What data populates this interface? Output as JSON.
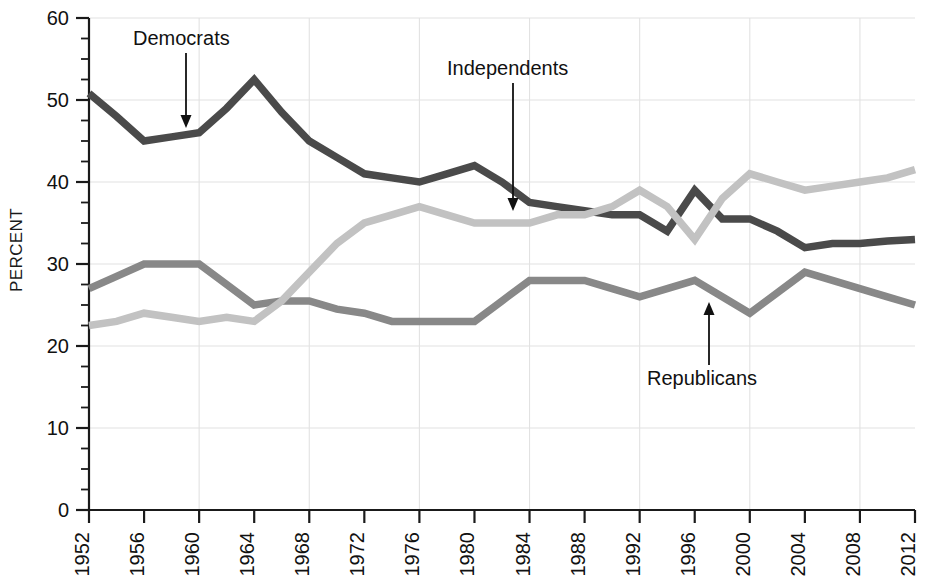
{
  "chart_data": {
    "type": "line",
    "title": "",
    "subtitle": "",
    "xlabel": "",
    "ylabel": "PERCENT",
    "xlim": [
      1952,
      2012
    ],
    "ylim": [
      0,
      60
    ],
    "ytick_step": 10,
    "yminor_step": 2.5,
    "grid": true,
    "grid_axis": "both",
    "legend_position": "inline-annotations",
    "x_tick_labels": [
      "1952",
      "1956",
      "1960",
      "1964",
      "1968",
      "1972",
      "1976",
      "1980",
      "1984",
      "1988",
      "1992",
      "1996",
      "2000",
      "2004",
      "2008",
      "2012"
    ],
    "y_tick_labels": [
      "0",
      "10",
      "20",
      "30",
      "40",
      "50",
      "60"
    ],
    "x": [
      1952,
      1954,
      1956,
      1958,
      1960,
      1962,
      1964,
      1966,
      1968,
      1970,
      1972,
      1974,
      1976,
      1978,
      1980,
      1982,
      1984,
      1986,
      1988,
      1990,
      1992,
      1994,
      1996,
      1998,
      2000,
      2002,
      2004,
      2006,
      2008,
      2010,
      2012
    ],
    "series": [
      {
        "name": "Democrats",
        "color": "#4a4a4a",
        "values": [
          50.8,
          48.0,
          45.0,
          45.5,
          46.0,
          49.0,
          52.5,
          48.5,
          45.0,
          43.0,
          41.0,
          40.5,
          40.0,
          41.0,
          42.0,
          40.0,
          37.5,
          37.0,
          36.5,
          36.0,
          36.0,
          34.0,
          39.0,
          35.5,
          35.5,
          34.0,
          32.0,
          32.5,
          32.5,
          32.8,
          33.0
        ]
      },
      {
        "name": "Republicans",
        "color": "#888888",
        "values": [
          27.0,
          28.5,
          30.0,
          30.0,
          30.0,
          27.5,
          25.0,
          25.5,
          25.5,
          24.5,
          24.0,
          23.0,
          23.0,
          23.0,
          23.0,
          25.5,
          28.0,
          28.0,
          28.0,
          27.0,
          26.0,
          27.0,
          28.0,
          26.0,
          24.0,
          26.5,
          29.0,
          28.0,
          27.0,
          26.0,
          25.0
        ]
      },
      {
        "name": "Independents",
        "color": "#c2c2c2",
        "values": [
          22.5,
          23.0,
          24.0,
          23.5,
          23.0,
          23.5,
          23.0,
          25.5,
          29.0,
          32.5,
          35.0,
          36.0,
          37.0,
          36.0,
          35.0,
          35.0,
          35.0,
          36.0,
          36.0,
          37.0,
          39.0,
          37.0,
          33.0,
          38.0,
          41.0,
          40.0,
          39.0,
          39.5,
          40.0,
          40.5,
          41.5
        ]
      }
    ],
    "annotations": [
      {
        "label": "Democrats",
        "text_x": 133,
        "text_y": 45,
        "arrow_x": 186,
        "arrow_y0": 53,
        "arrow_y1": 128,
        "direction": "down"
      },
      {
        "label": "Independents",
        "text_x": 447,
        "text_y": 75,
        "arrow_x": 513,
        "arrow_y0": 83,
        "arrow_y1": 211,
        "direction": "down"
      },
      {
        "label": "Republicans",
        "text_x": 647,
        "text_y": 385,
        "arrow_x": 709,
        "arrow_y0": 365,
        "arrow_y1": 302,
        "direction": "up"
      }
    ]
  },
  "axes": {
    "plot_left": 89,
    "plot_right": 915,
    "plot_top": 18,
    "plot_bottom": 510
  }
}
